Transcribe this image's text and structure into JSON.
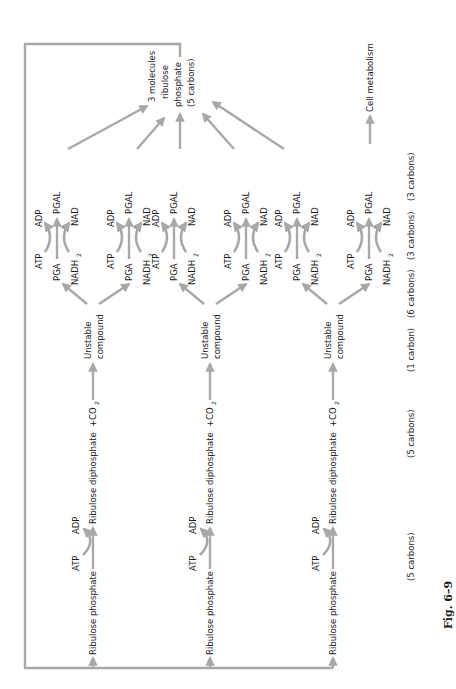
{
  "figure": {
    "caption": "Fig. 6–9",
    "output_label": [
      "3 molecules",
      "ribulose",
      "phosphate",
      "(5 carbons)"
    ],
    "side_output": "Cell metabolism",
    "rows": [
      {
        "start": "Ribulose phosphate",
        "atp_in": "ATP",
        "adp_out": "ADP",
        "product": "Ribulose diphosphate",
        "plus_co2": "+CO",
        "co2_sub": "2",
        "unstable": [
          "Unstable",
          "compound"
        ],
        "branches": [
          {
            "pga": "PGA",
            "atp": "ATP",
            "adp": "ADP",
            "nadh": "NADH",
            "nadh_sub": "2",
            "nad": "NAD",
            "pgal": "PGAL"
          },
          {
            "pga": "PGA",
            "atp": "ATP",
            "adp": "ADP",
            "nadh": "NADH",
            "nadh_sub": "2",
            "nad": "NAD",
            "pgal": "PGAL"
          }
        ]
      },
      {
        "start": "Ribulose phosphate",
        "atp_in": "ATP",
        "adp_out": "ADP",
        "product": "Ribulose diphosphate",
        "plus_co2": "+CO",
        "co2_sub": "2",
        "unstable": [
          "Unstable",
          "compound"
        ],
        "branches": [
          {
            "pga": "PGA",
            "atp": "ATP",
            "adp": "ADP",
            "nadh": "NADH",
            "nadh_sub": "2",
            "nad": "NAD",
            "pgal": "PGAL"
          },
          {
            "pga": "PGA",
            "atp": "ATP",
            "adp": "ADP",
            "nadh": "NADH",
            "nadh_sub": "2",
            "nad": "NAD",
            "pgal": "PGAL"
          }
        ]
      },
      {
        "start": "Ribulose phosphate",
        "atp_in": "ATP",
        "adp_out": "ADP",
        "product": "Ribulose diphosphate",
        "plus_co2": "+CO",
        "co2_sub": "2",
        "unstable": [
          "Unstable",
          "compound"
        ],
        "branches": [
          {
            "pga": "PGA",
            "atp": "ATP",
            "adp": "ADP",
            "nadh": "NADH",
            "nadh_sub": "2",
            "nad": "NAD",
            "pgal": "PGAL"
          },
          {
            "pga": "PGA",
            "atp": "ATP",
            "adp": "ADP",
            "nadh": "NADH",
            "nadh_sub": "2",
            "nad": "NAD",
            "pgal": "PGAL"
          }
        ]
      }
    ],
    "carbon_labels": [
      "(5 carbons)",
      "(5 carbons)",
      "(1 carbon)",
      "(6 carbons)",
      "(3 carbons)",
      "(3 carbons)"
    ]
  }
}
